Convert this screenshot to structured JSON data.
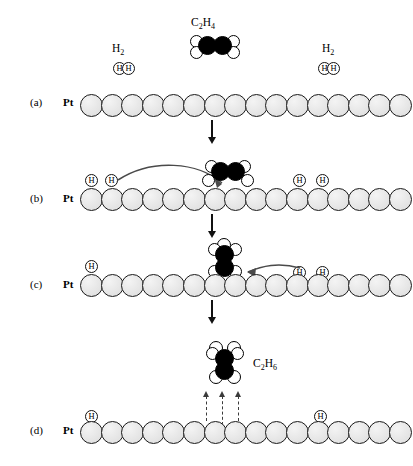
{
  "figure": {
    "substrate_label": "Pt",
    "colors": {
      "carbon": "#000000",
      "hydrogen": "#ffffff",
      "platinum": "#e9e9e9",
      "outline": "#1a1a1a",
      "arrow": "#111111",
      "dashed_arrow": "#3b3b3b"
    }
  },
  "panels": [
    {
      "letter": "(a)",
      "substrate": "Pt",
      "pt_atom_count": 16,
      "caption_species": [
        "H2",
        "C2H4",
        "H2"
      ],
      "gas_species": [
        {
          "name": "H2",
          "formula_main": "H",
          "formula_sub": "2",
          "state": "gas"
        },
        {
          "name": "C2H4",
          "formula": "C2H4",
          "state": "gas"
        },
        {
          "name": "H2",
          "formula_main": "H",
          "formula_sub": "2",
          "state": "gas"
        }
      ],
      "adsorbed_hydrogen_count": 0
    },
    {
      "letter": "(b)",
      "substrate": "Pt",
      "pt_atom_count": 16,
      "adsorbed_hydrogen_count": 4,
      "adsorbed_hydrogen_label": "H",
      "adsorbed_species": "C2H4",
      "has_transfer_arrow": true
    },
    {
      "letter": "(c)",
      "substrate": "Pt",
      "pt_atom_count": 16,
      "adsorbed_hydrogen_count": 3,
      "adsorbed_hydrogen_label": "H",
      "adsorbed_species": "C2H5",
      "has_transfer_arrow": true
    },
    {
      "letter": "(d)",
      "substrate": "Pt",
      "pt_atom_count": 16,
      "adsorbed_hydrogen_count": 2,
      "adsorbed_hydrogen_label": "H",
      "desorbing_species": "C2H6",
      "desorption_arrow_count": 3
    }
  ],
  "labels": {
    "panel_a": "(a)",
    "panel_b": "(b)",
    "panel_c": "(c)",
    "panel_d": "(d)",
    "pt": "Pt",
    "h_atom": "H",
    "h2_main": "H",
    "h2_sub": "2",
    "ethylene_c": "C",
    "ethylene_c_sub": "2",
    "ethylene_h": "H",
    "ethylene_h_sub": "4",
    "ethane_c": "C",
    "ethane_c_sub": "2",
    "ethane_h": "H",
    "ethane_h_sub": "6"
  }
}
